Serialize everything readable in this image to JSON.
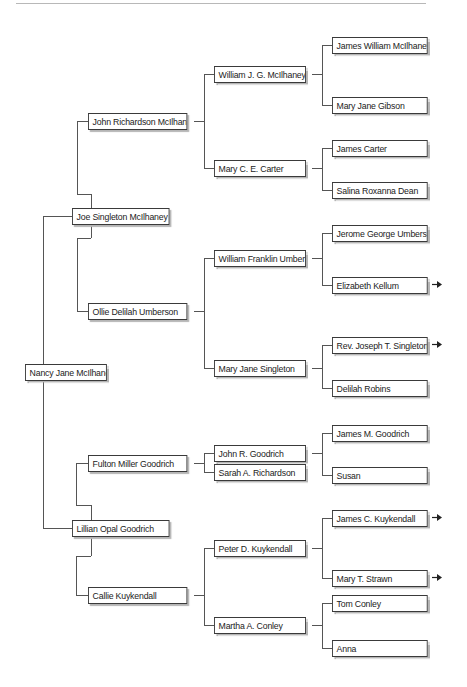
{
  "chart": {
    "type": "pedigree",
    "root": {
      "name": "Nancy Jane McIlhaney"
    },
    "generation1": [
      {
        "name": "Joe Singleton McIlhaney Sr."
      },
      {
        "name": "Lillian Opal Goodrich"
      }
    ],
    "generation2": [
      {
        "name": "John Richardson McIlhaney"
      },
      {
        "name": "Ollie Delilah Umberson"
      },
      {
        "name": "Fulton Miller Goodrich"
      },
      {
        "name": "Callie Kuykendall"
      }
    ],
    "generation3": [
      {
        "name": "William J. G. McIlhaney"
      },
      {
        "name": "Mary C. E. Carter"
      },
      {
        "name": "William Franklin Umberson"
      },
      {
        "name": "Mary Jane Singleton"
      },
      {
        "name": "John R. Goodrich"
      },
      {
        "name": "Sarah A. Richardson"
      },
      {
        "name": "Peter D. Kuykendall"
      },
      {
        "name": "Martha A. Conley"
      }
    ],
    "generation4": [
      {
        "name": "James William McIlhaney",
        "continues": false
      },
      {
        "name": "Mary Jane Gibson",
        "continues": false
      },
      {
        "name": "James Carter",
        "continues": false
      },
      {
        "name": "Salina Roxanna Dean",
        "continues": false
      },
      {
        "name": "Jerome George Umberson",
        "continues": false
      },
      {
        "name": "Elizabeth Kellum",
        "continues": true
      },
      {
        "name": "Rev. Joseph T. Singleton",
        "continues": true
      },
      {
        "name": "Delilah Robins",
        "continues": false
      },
      {
        "name": "James M. Goodrich",
        "continues": false
      },
      {
        "name": "Susan",
        "continues": false
      },
      {
        "name": "James C. Kuykendall",
        "continues": true
      },
      {
        "name": "Mary T. Strawn",
        "continues": true
      },
      {
        "name": "Tom Conley",
        "continues": false
      },
      {
        "name": "Anna",
        "continues": false
      }
    ],
    "icons": {
      "continuation": "arrow-right-icon"
    },
    "colors": {
      "line": "#555555",
      "border": "#3a3a3a",
      "shadow": "#b5b5b5",
      "background": "#ffffff"
    }
  }
}
